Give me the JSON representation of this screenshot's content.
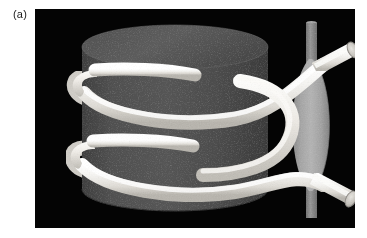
{
  "figure": {
    "panel_label": "(a)",
    "caption_text": "(a)",
    "background_color": "#ffffff",
    "scene_background_color": "#030303"
  },
  "scene": {
    "name": "helical-coil-around-cylinder-with-spindle",
    "elements": [
      {
        "name": "cylinder",
        "label": "dark cylinder core",
        "body_color": "#4d4d4d",
        "top_color": "#5a5a5a",
        "edge_color": "#3a3a3a"
      },
      {
        "name": "helix-ribbon",
        "label": "white helical tube wound around cylinder",
        "color": "#f0efec",
        "shade_color": "#c9c7c2",
        "turns": 2
      },
      {
        "name": "spindle",
        "label": "grey lens-shaped spindle",
        "color": "#a9a9a9",
        "highlight_color": "#bdbdbd",
        "shade_color": "#8e8e8e"
      },
      {
        "name": "vertical-rod",
        "label": "grey vertical axis rod",
        "color": "#8f8f8f",
        "shade_color": "#777777"
      },
      {
        "name": "tube-end-top",
        "label": "open tube end, upper right",
        "cap_color": "#d8d6d1"
      },
      {
        "name": "tube-end-bottom",
        "label": "open tube end, lower right",
        "cap_color": "#d8d6d1"
      }
    ]
  },
  "geometry": {
    "panel": {
      "x": 35,
      "y": 9,
      "width": 320,
      "height": 219
    },
    "cylinder": {
      "cx": 140,
      "top_cy": 38,
      "rx": 93,
      "ry": 22,
      "height": 152
    },
    "spindle": {
      "cx": 282,
      "cy": 115,
      "half_width": 22,
      "half_height": 66
    },
    "rod": {
      "x": 276,
      "top": 15,
      "bottom": 209,
      "width": 11
    }
  }
}
